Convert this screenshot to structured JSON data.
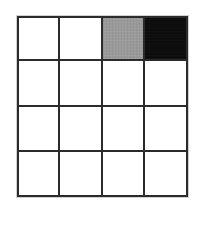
{
  "figure": {
    "kind": "grid-diagram",
    "background_color": "#ffffff",
    "gridline_color": "#2b2b2b",
    "rows": 4,
    "columns": 4,
    "fills": {
      "white": "#ffffff",
      "gray": "#9a9a9a",
      "black": "#0d0d0d"
    },
    "cells": [
      [
        {
          "fill": "white",
          "label": ""
        },
        {
          "fill": "white",
          "label": ""
        },
        {
          "fill": "gray",
          "label": ""
        },
        {
          "fill": "black",
          "label": ""
        }
      ],
      [
        {
          "fill": "white",
          "label": ""
        },
        {
          "fill": "white",
          "label": ""
        },
        {
          "fill": "white",
          "label": ""
        },
        {
          "fill": "white",
          "label": ""
        }
      ],
      [
        {
          "fill": "white",
          "label": ""
        },
        {
          "fill": "white",
          "label": ""
        },
        {
          "fill": "white",
          "label": ""
        },
        {
          "fill": "white",
          "label": ""
        }
      ],
      [
        {
          "fill": "white",
          "label": ""
        },
        {
          "fill": "white",
          "label": ""
        },
        {
          "fill": "white",
          "label": ""
        },
        {
          "fill": "white",
          "label": ""
        }
      ]
    ]
  }
}
